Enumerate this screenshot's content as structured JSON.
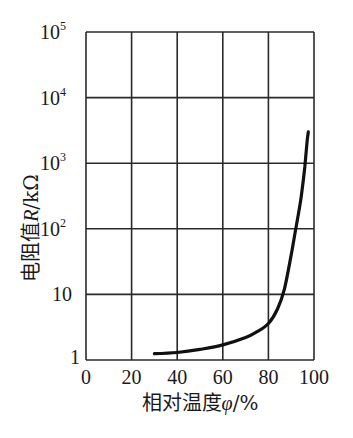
{
  "chart_data": {
    "type": "line",
    "title": "",
    "xlabel": "相对温度φ/%",
    "xlabel_parts": {
      "text": "相对温度",
      "symbol": "φ",
      "unit": "/%"
    },
    "ylabel": "电阻值R/kΩ",
    "ylabel_parts": {
      "text": "电阻值",
      "symbol": "R",
      "unit": "/kΩ"
    },
    "xlim": [
      0,
      100
    ],
    "ylim": [
      1,
      100000
    ],
    "yscale": "log",
    "grid": true,
    "legend": null,
    "x_ticks": [
      "0",
      "20",
      "40",
      "60",
      "80",
      "100"
    ],
    "x_tick_values": [
      0,
      20,
      40,
      60,
      80,
      100
    ],
    "y_ticks": [
      {
        "value": 1,
        "base": "1",
        "exp": ""
      },
      {
        "value": 10,
        "base": "10",
        "exp": ""
      },
      {
        "value": 100,
        "base": "10",
        "exp": "2"
      },
      {
        "value": 1000,
        "base": "10",
        "exp": "3"
      },
      {
        "value": 10000,
        "base": "10",
        "exp": "4"
      },
      {
        "value": 100000,
        "base": "10",
        "exp": "5"
      }
    ],
    "series": [
      {
        "name": "R vs φ",
        "color": "#111111",
        "x": [
          30,
          40,
          50,
          60,
          70,
          75,
          80,
          84,
          87,
          90,
          92,
          94,
          95,
          96,
          96.5,
          97,
          97.5
        ],
        "y": [
          1.25,
          1.3,
          1.45,
          1.7,
          2.2,
          2.7,
          3.6,
          6,
          12,
          40,
          100,
          250,
          450,
          900,
          1400,
          2200,
          3000
        ]
      }
    ]
  },
  "colors": {
    "grid": "#2a2a2a",
    "curve": "#111111",
    "background": "#ffffff"
  }
}
